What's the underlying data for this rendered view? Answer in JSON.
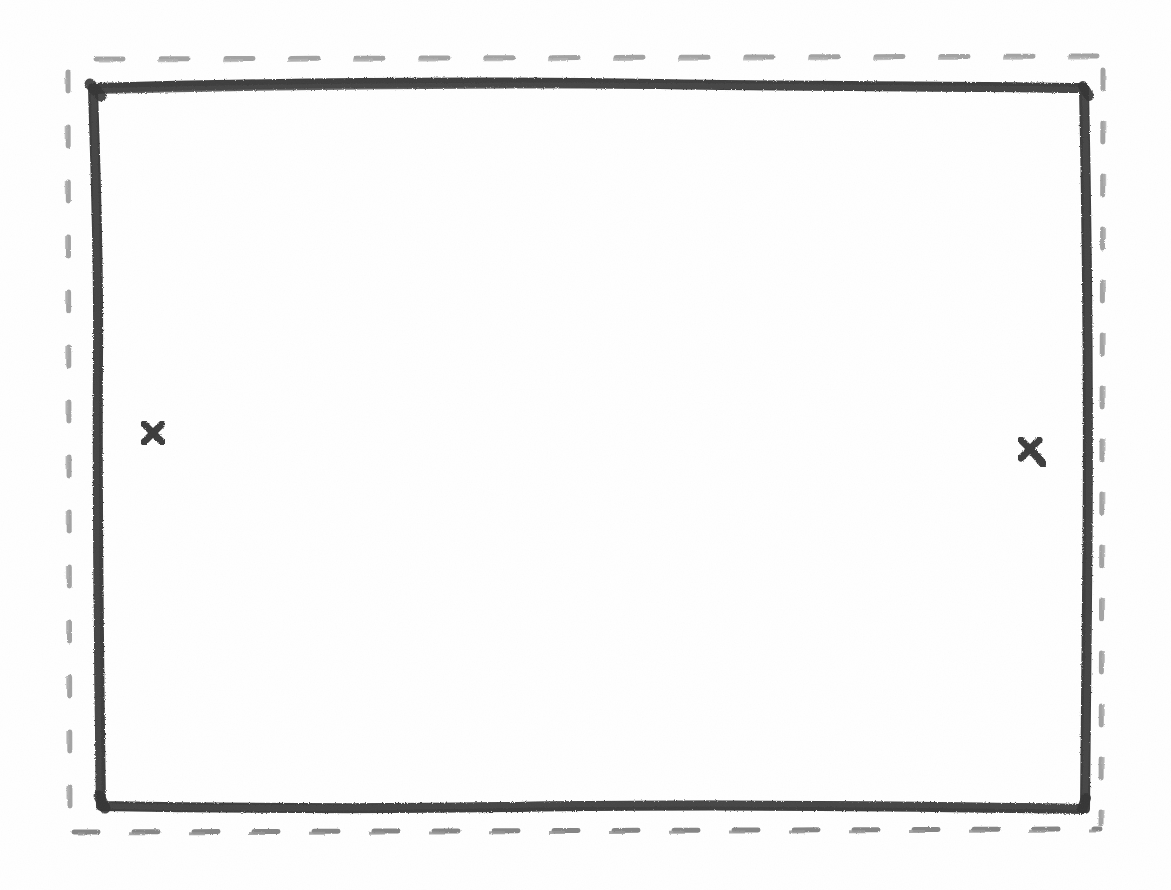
{
  "canvas": {
    "width": 1171,
    "height": 890,
    "background_color": "#ffffff",
    "medium": "hand-drawn pencil sketch on white paper",
    "interior_content": ""
  },
  "palette": {
    "ink_dark": "#3c3c3c",
    "ink_dark_edge": "#4a4a4a",
    "dash_gray": "#9b9b9b",
    "dash_gray_bottom": "#7e7e7e",
    "paper": "#ffffff"
  },
  "shapes": {
    "outer_dashed_frame": {
      "label": "outer dashed border",
      "style": "dashed",
      "stroke_color": "#9b9b9b",
      "stroke_width": 4,
      "left": 67,
      "top": 58,
      "right": 1103,
      "bottom": 830,
      "dash_length_horizontal": 26,
      "dash_gap_horizontal": 38,
      "dash_length_vertical": 18,
      "dash_gap_vertical": 36
    },
    "inner_solid_frame": {
      "label": "inner solid rectangle",
      "style": "solid",
      "stroke_color": "#3c3c3c",
      "stroke_width": 10,
      "left": 92,
      "top": 83,
      "right": 1087,
      "bottom": 808,
      "hand_drawn": true
    }
  },
  "marks": [
    {
      "id": "x-mark-left",
      "label": "x",
      "glyph": "✕",
      "color": "#3c3c3c",
      "center_x": 153,
      "center_y": 433,
      "size": 20,
      "stroke_width": 6,
      "has_tail": false
    },
    {
      "id": "x-mark-right",
      "label": "x",
      "glyph": "✕",
      "color": "#3c3c3c",
      "center_x": 1030,
      "center_y": 450,
      "size": 22,
      "stroke_width": 6,
      "has_tail": true
    }
  ]
}
